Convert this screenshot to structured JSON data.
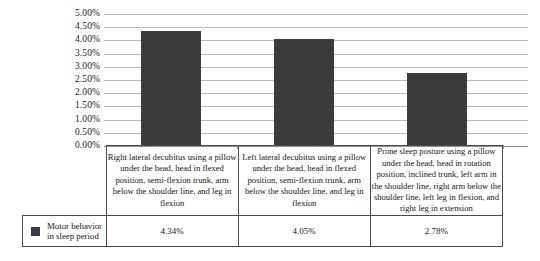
{
  "chart_data": {
    "type": "bar",
    "title": "",
    "xlabel": "",
    "ylabel": "",
    "ylim": [
      0,
      5
    ],
    "grid": true,
    "legend_position": "bottom-left-table",
    "categories": [
      "Right lateral decubitus using a pillow under the head, head in flexed position, semi-flexion trunk, arm below the shoulder line, and leg in flexion",
      "Left lateral decubitus using a pillow under the head, head in flexed position, semi-flexion trunk, arm below the shoulder line, and leg in flexion",
      "Prone sleep posture using a pillow under the head, head in rotation position, inclined trunk, left arm in the shoulder line, right arm below the shoulder line, left leg in flexion, and right leg in extension"
    ],
    "series": [
      {
        "name": "Motor behavior in sleep period",
        "values": [
          4.34,
          4.05,
          2.78
        ],
        "value_labels": [
          "4.34%",
          "4.05%",
          "2.78%"
        ],
        "color": "#3b3b3b"
      }
    ],
    "y_ticks": [
      "5.00%",
      "4.50%",
      "4.00%",
      "3.50%",
      "3.00%",
      "2.50%",
      "2.00%",
      "1.50%",
      "1.00%",
      "0.50%",
      "0.00%"
    ],
    "y_tick_values": [
      5.0,
      4.5,
      4.0,
      3.5,
      3.0,
      2.5,
      2.0,
      1.5,
      1.0,
      0.5,
      0.0
    ]
  },
  "legend": {
    "label_line1": "Motor behavior",
    "label_line2": "in sleep period",
    "swatch_color": "#3b3b3b"
  },
  "colors": {
    "bar": "#3b3b3b",
    "gridline": "#b9b9b9",
    "axis": "#8f8f8f",
    "table_border": "#4a4a4a",
    "text": "#171717",
    "background": "#ffffff"
  }
}
